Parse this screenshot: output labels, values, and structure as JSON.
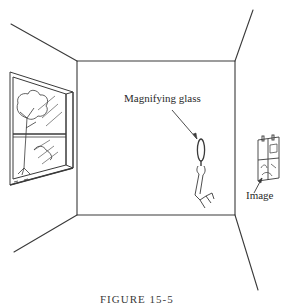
{
  "figure": {
    "labels": {
      "magnifier": "Magnifying glass",
      "image": "Image"
    },
    "caption": "FIGURE 15-5",
    "colors": {
      "line": "#3a3a3a",
      "background": "#ffffff"
    }
  }
}
